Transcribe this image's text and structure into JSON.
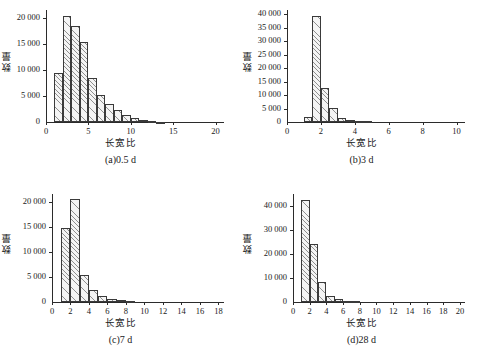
{
  "figure": {
    "panels": [
      {
        "id": "a",
        "caption": "(a)0.5 d",
        "xlabel": "长宽比",
        "ylabel": "数量",
        "chart_data": {
          "type": "bar",
          "title": "(a)0.5 d",
          "xlabel": "长宽比",
          "ylabel": "数量",
          "xlim": [
            0,
            21
          ],
          "ylim": [
            0,
            21500
          ],
          "xticks": [
            0,
            5,
            10,
            15,
            20
          ],
          "xtick_labels": [
            "0",
            "5",
            "10",
            "15",
            "20"
          ],
          "yticks": [
            0,
            5000,
            10000,
            15000,
            20000
          ],
          "ytick_labels": [
            "0",
            "5 000",
            "10 000",
            "15 000",
            "20 000"
          ],
          "grid": false,
          "legend": "none",
          "bin_width": 1,
          "bin_edges": [
            1,
            2,
            3,
            4,
            5,
            6,
            7,
            8,
            9,
            10,
            11,
            12,
            13,
            14
          ],
          "bin_centers": [
            1.5,
            2.5,
            3.5,
            4.5,
            5.5,
            6.5,
            7.5,
            8.5,
            9.5,
            10.5,
            11.5,
            12.5,
            13.5
          ],
          "values": [
            9500,
            20400,
            18500,
            15300,
            8400,
            5200,
            3400,
            2300,
            1300,
            750,
            350,
            180,
            90
          ]
        }
      },
      {
        "id": "b",
        "caption": "(b)3 d",
        "xlabel": "长宽比",
        "ylabel": "数量",
        "chart_data": {
          "type": "bar",
          "title": "(b)3 d",
          "xlabel": "长宽比",
          "ylabel": "数量",
          "xlim": [
            0,
            10.5
          ],
          "ylim": [
            0,
            41500
          ],
          "xticks": [
            0,
            2,
            4,
            6,
            8,
            10
          ],
          "xtick_labels": [
            "0",
            "2",
            "4",
            "6",
            "8",
            "10"
          ],
          "yticks": [
            0,
            5000,
            10000,
            15000,
            20000,
            25000,
            30000,
            35000,
            40000
          ],
          "ytick_labels": [
            "0",
            "5 000",
            "10 000",
            "15 000",
            "20 000",
            "25 000",
            "30 000",
            "35 000",
            "40 000"
          ],
          "grid": false,
          "legend": "none",
          "bin_width": 0.5,
          "bin_edges": [
            1.0,
            1.5,
            2.0,
            2.5,
            3.0,
            3.5,
            4.0,
            4.5,
            5.0
          ],
          "bin_centers": [
            1.25,
            1.75,
            2.25,
            2.75,
            3.25,
            3.75,
            4.25,
            4.75
          ],
          "values": [
            1800,
            39100,
            12500,
            5200,
            1400,
            700,
            400,
            250
          ]
        }
      },
      {
        "id": "c",
        "caption": "(c)7 d",
        "xlabel": "长宽比",
        "ylabel": "数量",
        "chart_data": {
          "type": "bar",
          "title": "(c)7 d",
          "xlabel": "长宽比",
          "ylabel": "数量",
          "xlim": [
            0,
            18.6
          ],
          "ylim": [
            0,
            21500
          ],
          "xticks": [
            0,
            2,
            4,
            6,
            8,
            10,
            12,
            14,
            16,
            18
          ],
          "xtick_labels": [
            "0",
            "2",
            "4",
            "6",
            "8",
            "10",
            "12",
            "14",
            "16",
            "18"
          ],
          "yticks": [
            0,
            5000,
            10000,
            15000,
            20000
          ],
          "ytick_labels": [
            "0",
            "5 000",
            "10 000",
            "15 000",
            "20 000"
          ],
          "grid": false,
          "legend": "none",
          "bin_width": 1,
          "bin_edges": [
            1,
            2,
            3,
            4,
            5,
            6,
            7,
            8,
            9
          ],
          "bin_centers": [
            1.5,
            2.5,
            3.5,
            4.5,
            5.5,
            6.5,
            7.5,
            8.5
          ],
          "values": [
            14800,
            20500,
            5300,
            2300,
            1100,
            600,
            400,
            200
          ]
        }
      },
      {
        "id": "d",
        "caption": "(d)28 d",
        "xlabel": "长宽比",
        "ylabel": "数量",
        "chart_data": {
          "type": "bar",
          "title": "(d)28 d",
          "xlabel": "长宽比",
          "ylabel": "数量",
          "xlim": [
            0,
            20.6
          ],
          "ylim": [
            0,
            45000
          ],
          "xticks": [
            0,
            2,
            4,
            6,
            8,
            10,
            12,
            14,
            16,
            18,
            20
          ],
          "xtick_labels": [
            "0",
            "2",
            "4",
            "6",
            "8",
            "10",
            "12",
            "14",
            "16",
            "18",
            "20"
          ],
          "yticks": [
            0,
            10000,
            20000,
            30000,
            40000
          ],
          "ytick_labels": [
            "0",
            "10 000",
            "20 000",
            "30 000",
            "40 000"
          ],
          "grid": false,
          "legend": "none",
          "bin_width": 1,
          "bin_edges": [
            1,
            2,
            3,
            4,
            5,
            6,
            7,
            8
          ],
          "bin_centers": [
            1.5,
            2.5,
            3.5,
            4.5,
            5.5,
            6.5,
            7.5
          ],
          "values": [
            42700,
            24200,
            8500,
            2700,
            1100,
            500,
            250
          ]
        }
      }
    ]
  }
}
